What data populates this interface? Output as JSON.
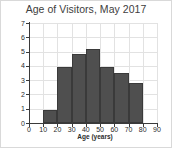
{
  "chart_data": {
    "type": "bar",
    "title": "Age of Visitors, May 2017",
    "xlabel": "Age (years)",
    "ylabel": "Frequency (000)",
    "subtitle": "",
    "categories": [
      "0-10",
      "10-20",
      "20-30",
      "30-40",
      "40-50",
      "50-60",
      "60-70",
      "70-80",
      "80-90"
    ],
    "bin_edges": [
      0,
      10,
      20,
      30,
      40,
      50,
      60,
      70,
      80,
      90
    ],
    "values": [
      0,
      0.9,
      3.9,
      4.85,
      5.2,
      3.9,
      3.5,
      2.8,
      0
    ],
    "xlim": [
      0,
      90
    ],
    "ylim": [
      0,
      7
    ],
    "xticks": [
      0,
      10,
      20,
      30,
      40,
      50,
      60,
      70,
      80,
      90
    ],
    "yticks": [
      0,
      1,
      2,
      3,
      4,
      5,
      6,
      7
    ],
    "xtick_labels": [
      "0",
      "10",
      "20",
      "30",
      "40",
      "50",
      "60",
      "70",
      "80",
      "90"
    ],
    "ytick_labels": [
      "0",
      "1",
      "2",
      "3",
      "4",
      "5",
      "6",
      "7"
    ],
    "grid": true,
    "legend": false,
    "bar_color": "#4f4f4f",
    "bar_edge_color": "#3a3a3a",
    "grid_color": "#e2e2e2",
    "axis_color": "#3a3a3a",
    "title_color": "#404040",
    "background_color": "#ffffff"
  }
}
